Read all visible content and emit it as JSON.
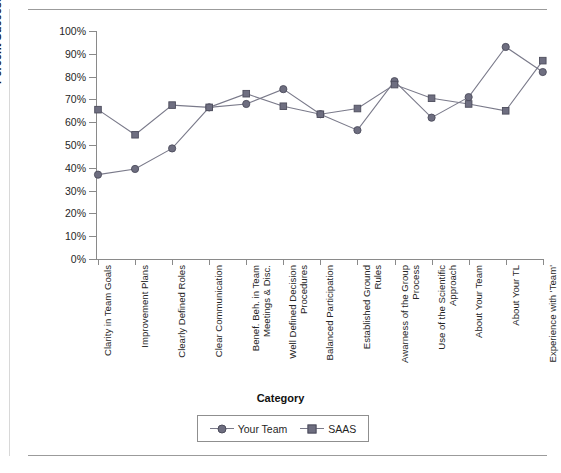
{
  "chart_data": {
    "type": "line",
    "title": "",
    "xlabel": "Category",
    "ylabel": "Percent Success",
    "ylim": [
      0,
      100
    ],
    "ytick_labels": [
      "0%",
      "10%",
      "20%",
      "30%",
      "40%",
      "50%",
      "60%",
      "70%",
      "80%",
      "90%",
      "100%"
    ],
    "ytick_values": [
      0,
      10,
      20,
      30,
      40,
      50,
      60,
      70,
      80,
      90,
      100
    ],
    "grid": false,
    "legend_position": "bottom",
    "categories": [
      "Clarity in Team Goals",
      "Improvement Plans",
      "Clearly Defined Roles",
      "Clear Communication",
      "Benef. Beh. in Team Meetings & Disc.",
      "Well Defined Decision Procedures",
      "Balanced Participation",
      "Established Ground Rules",
      "Awarness of the Group Process",
      "Use of the Scientific Approach",
      "About Your Team",
      "About Your TL",
      "Experience with 'Team'"
    ],
    "category_lines": [
      [
        "Clarity in Team Goals"
      ],
      [
        "Improvement Plans"
      ],
      [
        "Clearly Defined Roles"
      ],
      [
        "Clear Communication"
      ],
      [
        "Benef. Beh. in Team",
        "Meetings & Disc."
      ],
      [
        "Well Defined Decision",
        "Procedures"
      ],
      [
        "Balanced Participation"
      ],
      [
        "Established Ground",
        "Rules"
      ],
      [
        "Awarness of the Group",
        "Process"
      ],
      [
        "Use of the Scientific",
        "Approach"
      ],
      [
        "About Your Team"
      ],
      [
        "About Your TL"
      ],
      [
        "Experience with 'Team'"
      ]
    ],
    "series": [
      {
        "name": "Your Team",
        "marker": "circle",
        "color": "#6e6e80",
        "values": [
          37,
          39.5,
          48.5,
          66.5,
          68,
          74.5,
          63.5,
          56.5,
          78,
          62,
          71,
          93,
          82
        ]
      },
      {
        "name": "SAAS",
        "marker": "square",
        "color": "#6e6e80",
        "values": [
          65.5,
          54.5,
          67.5,
          66.5,
          72.5,
          67,
          63.5,
          66,
          76.5,
          70.5,
          68,
          65,
          87
        ]
      }
    ]
  },
  "legend": {
    "items": [
      {
        "label": "Your Team",
        "marker": "circle"
      },
      {
        "label": "SAAS",
        "marker": "square"
      }
    ]
  },
  "colors": {
    "series": "#6e6e80",
    "axis": "#8a8a8a",
    "text": "#1a1a1a",
    "rule": "#9b9b9b"
  }
}
